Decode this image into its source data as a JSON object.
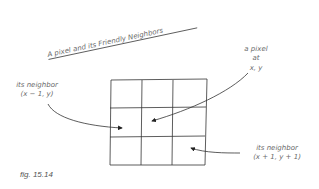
{
  "title": "A pixel and its Friendly Neighbors",
  "labels": {
    "pixel": [
      "a pixel",
      "at",
      "x, y"
    ],
    "left_neighbor": [
      "its neighbor",
      "(x − 1, y)"
    ],
    "bottom_right_neighbor": [
      "its neighbor",
      "(x + 1, y + 1)"
    ]
  },
  "grid": {
    "rows": 3,
    "cols": 3
  },
  "caption": "fig. 15.14",
  "colors": {
    "line": "#333333",
    "text": "#6a6a6a"
  }
}
